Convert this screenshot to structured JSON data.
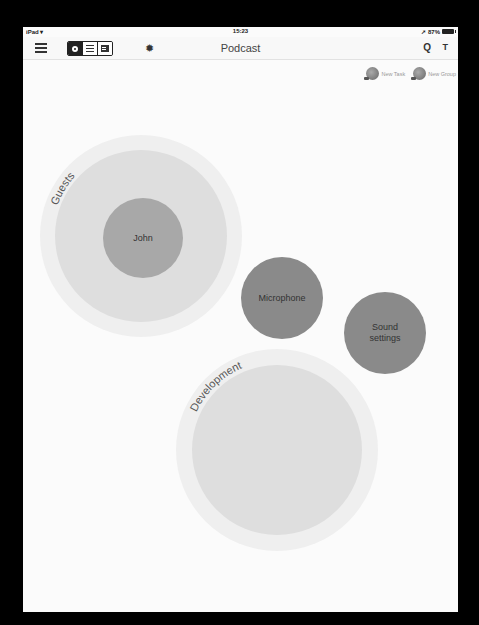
{
  "status_bar": {
    "device": "iPad",
    "wifi_icon": "wifi-icon",
    "time": "15:23",
    "location_icon": "location-arrow-icon",
    "battery_percent": "87%",
    "battery_icon": "battery-icon"
  },
  "toolbar": {
    "menu_icon": "hamburger-menu-icon",
    "view_modes": [
      {
        "name": "bubble-view",
        "icon": "circle-icon",
        "selected": true
      },
      {
        "name": "list-view",
        "icon": "list-icon",
        "selected": false
      },
      {
        "name": "detail-view",
        "icon": "card-icon",
        "selected": false
      }
    ],
    "settings_icon": "gear-icon",
    "gear_glyph": "✹",
    "title": "Podcast",
    "search_glyph": "Q",
    "filter_glyph": "T"
  },
  "actions": {
    "new_task_label": "New Task",
    "new_group_label": "New Group"
  },
  "canvas": {
    "groups": [
      {
        "label": "Guests",
        "cx": 118,
        "cy": 209,
        "r_outer": 101,
        "r_inner": 86
      },
      {
        "label": "Development",
        "cx": 254,
        "cy": 423,
        "r_outer": 101,
        "r_inner": 85
      }
    ],
    "tasks": [
      {
        "label": "John",
        "cx": 120,
        "cy": 211,
        "r": 40,
        "group": "Guests"
      },
      {
        "label": "Microphone",
        "cx": 259,
        "cy": 271,
        "r": 41
      },
      {
        "label": "Sound settings",
        "label_line1": "Sound",
        "label_line2": "settings",
        "cx": 362,
        "cy": 306,
        "r": 41
      }
    ],
    "colors": {
      "background": "#fbfbfb",
      "group_outer": "#efefef",
      "group_inner": "#dedede",
      "task_dark": "#8a8a8a",
      "task_nested": "#a8a8a8"
    }
  }
}
